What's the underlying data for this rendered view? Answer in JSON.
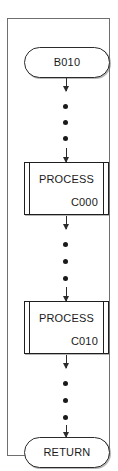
{
  "diagram": {
    "type": "flowchart",
    "orientation": "vertical",
    "nodes": [
      {
        "id": "start",
        "shape": "terminator",
        "label": "B010"
      },
      {
        "id": "process-c000",
        "shape": "predefined-process",
        "title": "PROCESS",
        "code": "C000"
      },
      {
        "id": "process-c010",
        "shape": "predefined-process",
        "title": "PROCESS",
        "code": "C010"
      },
      {
        "id": "end",
        "shape": "terminator",
        "label": "RETURN"
      }
    ],
    "connectors": [
      {
        "from": "start",
        "to": "process-c000",
        "style": "arrow-dotted",
        "dots": 3
      },
      {
        "from": "process-c000",
        "to": "process-c010",
        "style": "arrow-dotted",
        "dots": 3
      },
      {
        "from": "process-c010",
        "to": "end",
        "style": "arrow-dotted",
        "dots": 3
      }
    ],
    "colors": {
      "line": "#2b2b2b",
      "frame": "#6f6f6f",
      "text": "#1a1a1a",
      "background": "#ffffff"
    }
  }
}
